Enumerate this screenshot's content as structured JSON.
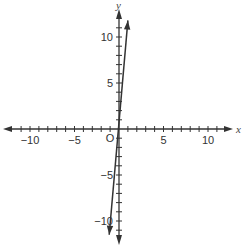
{
  "chart_data": {
    "type": "line",
    "title": "",
    "xlabel": "x",
    "ylabel": "y",
    "origin_label": "O",
    "xlim": [
      -11.5,
      11.5
    ],
    "ylim": [
      -12,
      12
    ],
    "x_ticks": [
      -10,
      -5,
      5,
      10
    ],
    "y_ticks": [
      10,
      5,
      -5,
      -10
    ],
    "x_tick_labels": [
      "−10",
      "−5",
      "5",
      "10"
    ],
    "y_tick_labels": [
      "10",
      "5",
      "−5",
      "−10"
    ],
    "grid": false,
    "series": [
      {
        "name": "line",
        "equation": "y = 10x",
        "points": [
          [
            -1.1,
            -11.5
          ],
          [
            1.0,
            11.8
          ]
        ],
        "arrows": "both"
      }
    ]
  }
}
